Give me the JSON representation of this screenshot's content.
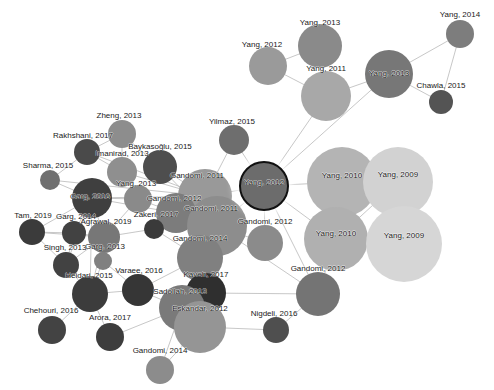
{
  "figure": {
    "type": "network-graph",
    "title": "",
    "width": 494,
    "height": 390,
    "background": "#ffffff",
    "edge_color": "#b9b9b9",
    "label_color": "#1a1a1a",
    "selected_node_id": "yang-2012-center",
    "selection_ring_color": "#111111"
  },
  "chart_data": {
    "type": "scatter",
    "title": "",
    "xlabel": "",
    "ylabel": "",
    "nodes": [
      {
        "id": "yang-2014",
        "label": "Yang, 2014",
        "x": 460,
        "y": 34,
        "r": 14,
        "color": "#7d7d7d",
        "label_dx": 0,
        "label_dy": -20
      },
      {
        "id": "yang-2013-top",
        "label": "Yang, 2013",
        "x": 320,
        "y": 46,
        "r": 22,
        "color": "#8a8a8a",
        "label_dx": 0,
        "label_dy": -24
      },
      {
        "id": "yang-2012-left",
        "label": "Yang, 2012",
        "x": 268,
        "y": 66,
        "r": 19,
        "color": "#9a9a9a",
        "label_dx": -6,
        "label_dy": -22
      },
      {
        "id": "yang-2011",
        "label": "Yang, 2011",
        "x": 326,
        "y": 96,
        "r": 25,
        "color": "#a8a8a8",
        "label_dx": 0,
        "label_dy": -28
      },
      {
        "id": "yang-2013-mid",
        "label": "Yang, 2013",
        "x": 389,
        "y": 74,
        "r": 24,
        "color": "#777777",
        "label_dx": 0,
        "label_dy": -1
      },
      {
        "id": "chawla-2015",
        "label": "Chawla, 2015",
        "x": 441,
        "y": 102,
        "r": 12,
        "color": "#545454",
        "label_dx": 0,
        "label_dy": -17
      },
      {
        "id": "zheng-2013",
        "label": "Zheng, 2013",
        "x": 122,
        "y": 134,
        "r": 14,
        "color": "#8d8d8d",
        "label_dx": -3,
        "label_dy": -19
      },
      {
        "id": "rakhshani-2017",
        "label": "Rakhshani, 2017",
        "x": 87,
        "y": 152,
        "r": 13,
        "color": "#4a4a4a",
        "label_dx": -4,
        "label_dy": -17
      },
      {
        "id": "sharma-2015",
        "label": "Sharma, 2015",
        "x": 50,
        "y": 180,
        "r": 10,
        "color": "#6f6f6f",
        "label_dx": -2,
        "label_dy": -15
      },
      {
        "id": "imanirad-2013",
        "label": "Imanirad, 2013",
        "x": 122,
        "y": 172,
        "r": 15,
        "color": "#8f8f8f",
        "label_dx": 0,
        "label_dy": -19
      },
      {
        "id": "baykasoglu-2015",
        "label": "Baykasoğlu, 2015",
        "x": 160,
        "y": 167,
        "r": 17,
        "color": "#4e4e4e",
        "label_dx": 0,
        "label_dy": -21
      },
      {
        "id": "yilmaz-2015",
        "label": "Yilmaz, 2015",
        "x": 234,
        "y": 140,
        "r": 15,
        "color": "#6e6e6e",
        "label_dx": -2,
        "label_dy": -19
      },
      {
        "id": "gandomi-2011-a",
        "label": "Gandomi, 2011",
        "x": 205,
        "y": 196,
        "r": 27,
        "color": "#999999",
        "label_dx": -8,
        "label_dy": -21
      },
      {
        "id": "gandomi-2012-a",
        "label": "Gandomi, 2012",
        "x": 176,
        "y": 213,
        "r": 20,
        "color": "#7c7c7c",
        "label_dx": -2,
        "label_dy": -15
      },
      {
        "id": "gandomi-2011-b",
        "label": "Gandomi, 2011",
        "x": 217,
        "y": 226,
        "r": 30,
        "color": "#8d8d8d",
        "label_dx": -6,
        "label_dy": -18
      },
      {
        "id": "yang-2012-center",
        "label": "Yang, 2012",
        "x": 264,
        "y": 186,
        "r": 25,
        "color": "#6c6c6c",
        "label_dx": 0,
        "label_dy": -4
      },
      {
        "id": "gandomi-2012-b",
        "label": "Gandomi, 2012",
        "x": 265,
        "y": 243,
        "r": 18,
        "color": "#8b8b8b",
        "label_dx": 0,
        "label_dy": -22
      },
      {
        "id": "yang-2010-a",
        "label": "Yang, 2010",
        "x": 342,
        "y": 182,
        "r": 35,
        "color": "#b4b4b4",
        "label_dx": 0,
        "label_dy": -7
      },
      {
        "id": "yang-2009-a",
        "label": "Yang, 2009",
        "x": 398,
        "y": 182,
        "r": 35,
        "color": "#d2d2d2",
        "label_dx": 0,
        "label_dy": -8
      },
      {
        "id": "yang-2010-b",
        "label": "Yang, 2010",
        "x": 336,
        "y": 239,
        "r": 32,
        "color": "#b0b0b0",
        "label_dx": 0,
        "label_dy": -6
      },
      {
        "id": "yang-2009-b",
        "label": "Yang, 2009",
        "x": 404,
        "y": 244,
        "r": 38,
        "color": "#d6d6d6",
        "label_dx": 0,
        "label_dy": -9
      },
      {
        "id": "gandomi-2012-c",
        "label": "Gandomi, 2012",
        "x": 318,
        "y": 294,
        "r": 22,
        "color": "#747474",
        "label_dx": 0,
        "label_dy": -26
      },
      {
        "id": "nigdeli-2016",
        "label": "Nigdeli, 2016",
        "x": 276,
        "y": 330,
        "r": 13,
        "color": "#4f4f4f",
        "label_dx": -2,
        "label_dy": -17
      },
      {
        "id": "garg-2016",
        "label": "Garg, 2016",
        "x": 92,
        "y": 198,
        "r": 20,
        "color": "#3f3f3f",
        "label_dx": -2,
        "label_dy": -2
      },
      {
        "id": "yang-2013-left",
        "label": "Yang, 2013",
        "x": 138,
        "y": 199,
        "r": 14,
        "color": "#8a8a8a",
        "label_dx": -2,
        "label_dy": -16
      },
      {
        "id": "tam-2019",
        "label": "Tam, 2019",
        "x": 32,
        "y": 232,
        "r": 13,
        "color": "#3b3b3b",
        "label_dx": 1,
        "label_dy": -17
      },
      {
        "id": "garg-2014",
        "label": "Garg, 2014",
        "x": 74,
        "y": 233,
        "r": 12,
        "color": "#424242",
        "label_dx": 2,
        "label_dy": -17
      },
      {
        "id": "agrawal-2019",
        "label": "Agrawal, 2019",
        "x": 104,
        "y": 237,
        "r": 16,
        "color": "#777777",
        "label_dx": 2,
        "label_dy": -16
      },
      {
        "id": "zakeri-2017",
        "label": "Zakeri, 2017",
        "x": 154,
        "y": 229,
        "r": 10,
        "color": "#3a3a3a",
        "label_dx": 2,
        "label_dy": -15
      },
      {
        "id": "singh-2013",
        "label": "Singh, 2013",
        "x": 66,
        "y": 265,
        "r": 13,
        "color": "#424242",
        "label_dx": -1,
        "label_dy": -18
      },
      {
        "id": "garg-2013",
        "label": "Garg, 2013",
        "x": 103,
        "y": 261,
        "r": 9,
        "color": "#808080",
        "label_dx": 2,
        "label_dy": -15
      },
      {
        "id": "heidari-2015",
        "label": "Heidari, 2015",
        "x": 90,
        "y": 294,
        "r": 18,
        "color": "#3c3c3c",
        "label_dx": -1,
        "label_dy": -19
      },
      {
        "id": "chehouri-2016",
        "label": "Chehouri, 2016",
        "x": 52,
        "y": 330,
        "r": 14,
        "color": "#434343",
        "label_dx": -1,
        "label_dy": -20
      },
      {
        "id": "arora-2017",
        "label": "Arora, 2017",
        "x": 110,
        "y": 337,
        "r": 14,
        "color": "#3d3d3d",
        "label_dx": 0,
        "label_dy": -20
      },
      {
        "id": "varaee-2016",
        "label": "Varaee, 2016",
        "x": 138,
        "y": 290,
        "r": 16,
        "color": "#363636",
        "label_dx": 1,
        "label_dy": -20
      },
      {
        "id": "gandomi-2014-a",
        "label": "Gandomi, 2014",
        "x": 200,
        "y": 258,
        "r": 23,
        "color": "#808080",
        "label_dx": 0,
        "label_dy": -20
      },
      {
        "id": "kaveh-2017",
        "label": "Kaveh, 2017",
        "x": 206,
        "y": 293,
        "r": 20,
        "color": "#2f2f2f",
        "label_dx": 0,
        "label_dy": -19
      },
      {
        "id": "sadollah-2013",
        "label": "Sadollah, 2013",
        "x": 182,
        "y": 308,
        "r": 23,
        "color": "#7a7a7a",
        "label_dx": -2,
        "label_dy": -17
      },
      {
        "id": "eskandar-2012",
        "label": "Eskandar, 2012",
        "x": 200,
        "y": 327,
        "r": 26,
        "color": "#959595",
        "label_dx": 0,
        "label_dy": -19
      },
      {
        "id": "gandomi-2014-b",
        "label": "Gandomi, 2014",
        "x": 160,
        "y": 370,
        "r": 14,
        "color": "#8c8c8c",
        "label_dx": 0,
        "label_dy": -20
      }
    ],
    "edges": [
      [
        "yang-2014",
        "yang-2013-mid"
      ],
      [
        "yang-2014",
        "chawla-2015"
      ],
      [
        "yang-2013-mid",
        "chawla-2015"
      ],
      [
        "yang-2013-mid",
        "yang-2011"
      ],
      [
        "yang-2011",
        "yang-2013-top"
      ],
      [
        "yang-2011",
        "yang-2012-left"
      ],
      [
        "yang-2013-top",
        "yang-2012-left"
      ],
      [
        "yang-2011",
        "yang-2012-center"
      ],
      [
        "yang-2013-mid",
        "yang-2012-center"
      ],
      [
        "zheng-2013",
        "rakhshani-2017"
      ],
      [
        "zheng-2013",
        "baykasoglu-2015"
      ],
      [
        "zheng-2013",
        "imanirad-2013"
      ],
      [
        "rakhshani-2017",
        "sharma-2015"
      ],
      [
        "rakhshani-2017",
        "imanirad-2013"
      ],
      [
        "rakhshani-2017",
        "gandomi-2011-a"
      ],
      [
        "sharma-2015",
        "garg-2016"
      ],
      [
        "sharma-2015",
        "gandomi-2011-a"
      ],
      [
        "imanirad-2013",
        "yang-2013-left"
      ],
      [
        "imanirad-2013",
        "gandomi-2011-a"
      ],
      [
        "baykasoglu-2015",
        "gandomi-2011-a"
      ],
      [
        "baykasoglu-2015",
        "gandomi-2011-b"
      ],
      [
        "yilmaz-2015",
        "yang-2012-center"
      ],
      [
        "yilmaz-2015",
        "gandomi-2011-a"
      ],
      [
        "gandomi-2011-a",
        "gandomi-2012-a"
      ],
      [
        "gandomi-2011-a",
        "gandomi-2011-b"
      ],
      [
        "gandomi-2011-a",
        "yang-2012-center"
      ],
      [
        "gandomi-2012-a",
        "gandomi-2011-b"
      ],
      [
        "gandomi-2011-b",
        "yang-2012-center"
      ],
      [
        "gandomi-2011-b",
        "gandomi-2012-b"
      ],
      [
        "gandomi-2011-b",
        "gandomi-2014-a"
      ],
      [
        "gandomi-2012-b",
        "yang-2012-center"
      ],
      [
        "yang-2012-center",
        "yang-2010-a"
      ],
      [
        "yang-2012-center",
        "yang-2010-b"
      ],
      [
        "yang-2010-a",
        "yang-2009-a"
      ],
      [
        "yang-2010-a",
        "yang-2010-b"
      ],
      [
        "yang-2009-a",
        "yang-2010-b"
      ],
      [
        "yang-2009-a",
        "yang-2009-b"
      ],
      [
        "yang-2010-b",
        "yang-2009-b"
      ],
      [
        "yang-2010-b",
        "gandomi-2012-c"
      ],
      [
        "yang-2012-center",
        "gandomi-2012-c"
      ],
      [
        "gandomi-2012-c",
        "kaveh-2017"
      ],
      [
        "gandomi-2012-c",
        "nigdeli-2016"
      ],
      [
        "garg-2016",
        "yang-2013-left"
      ],
      [
        "garg-2016",
        "agrawal-2019"
      ],
      [
        "garg-2016",
        "garg-2014"
      ],
      [
        "garg-2016",
        "tam-2019"
      ],
      [
        "garg-2016",
        "singh-2013"
      ],
      [
        "garg-2016",
        "heidari-2015"
      ],
      [
        "garg-2016",
        "gandomi-2011-a"
      ],
      [
        "garg-2016",
        "gandomi-2012-a"
      ],
      [
        "yang-2013-left",
        "gandomi-2012-a"
      ],
      [
        "yang-2013-left",
        "agrawal-2019"
      ],
      [
        "tam-2019",
        "garg-2014"
      ],
      [
        "tam-2019",
        "agrawal-2019"
      ],
      [
        "tam-2019",
        "singh-2013"
      ],
      [
        "garg-2014",
        "agrawal-2019"
      ],
      [
        "garg-2014",
        "singh-2013"
      ],
      [
        "agrawal-2019",
        "zakeri-2017"
      ],
      [
        "agrawal-2019",
        "garg-2013"
      ],
      [
        "agrawal-2019",
        "singh-2013"
      ],
      [
        "agrawal-2019",
        "heidari-2015"
      ],
      [
        "zakeri-2017",
        "gandomi-2011-b"
      ],
      [
        "zakeri-2017",
        "gandomi-2014-a"
      ],
      [
        "garg-2013",
        "heidari-2015"
      ],
      [
        "garg-2013",
        "varaee-2016"
      ],
      [
        "singh-2013",
        "heidari-2015"
      ],
      [
        "heidari-2015",
        "chehouri-2016"
      ],
      [
        "heidari-2015",
        "arora-2017"
      ],
      [
        "heidari-2015",
        "varaee-2016"
      ],
      [
        "varaee-2016",
        "gandomi-2014-a"
      ],
      [
        "varaee-2016",
        "sadollah-2013"
      ],
      [
        "arora-2017",
        "sadollah-2013"
      ],
      [
        "gandomi-2014-a",
        "kaveh-2017"
      ],
      [
        "gandomi-2014-a",
        "sadollah-2013"
      ],
      [
        "gandomi-2014-a",
        "gandomi-2011-b"
      ],
      [
        "kaveh-2017",
        "eskandar-2012"
      ],
      [
        "sadollah-2013",
        "eskandar-2012"
      ],
      [
        "sadollah-2013",
        "gandomi-2014-b"
      ],
      [
        "eskandar-2012",
        "gandomi-2014-b"
      ],
      [
        "eskandar-2012",
        "nigdeli-2016"
      ],
      [
        "gandomi-2011-b",
        "gandomi-2012-c"
      ]
    ]
  }
}
